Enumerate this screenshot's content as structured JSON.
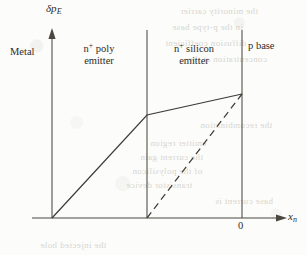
{
  "figure": {
    "background_color": "#fcfcfa",
    "ink_color": "#403d37"
  },
  "axes": {
    "y_label_main": "δp",
    "y_label_sub": "E",
    "x_label_main": "x",
    "x_label_sub": "n",
    "x_tick_label": "0",
    "x_axis_from_px": 32,
    "x_axis_to_px": 285,
    "x_axis_y_px": 218,
    "y_axis_x_px": 52,
    "y_axis_top_px": 33,
    "y_axis_bottom_px": 218
  },
  "regions": [
    {
      "name": "metal",
      "label_line1": "Metal",
      "label_line2": "",
      "superscript": "",
      "x_center_px": 30,
      "y_px": 52
    },
    {
      "name": "poly-emitter",
      "label_line1": "n poly",
      "label_line2": "emitter",
      "superscript": "+",
      "x_center_px": 99,
      "y_px": 46
    },
    {
      "name": "silicon-emitter",
      "label_line1": "n silicon",
      "label_line2": "emitter",
      "superscript": "+",
      "x_center_px": 194,
      "y_px": 46
    },
    {
      "name": "p-base",
      "label_line1": "p base",
      "label_line2": "",
      "superscript": "",
      "x_center_px": 268,
      "y_px": 46
    }
  ],
  "dividers": [
    {
      "name": "poly-silicon-interface",
      "x_px": 147,
      "y_top_px": 30,
      "y_bottom_px": 218
    },
    {
      "name": "emitter-base-junction",
      "x_px": 242,
      "y_top_px": 30,
      "y_bottom_px": 218
    }
  ],
  "chart_data": {
    "type": "line",
    "xlabel": "x_n",
    "ylabel": "δp_E",
    "grid": false,
    "legend": "none",
    "series": [
      {
        "name": "polysilicon-emitter-profile-solid",
        "style": "solid",
        "points_px": [
          [
            52,
            218
          ],
          [
            147,
            115
          ],
          [
            242,
            94
          ]
        ],
        "description": "Steep linear rise through the n+ poly emitter, then a shallower linear rise across the n+ silicon emitter to the base edge"
      },
      {
        "name": "ideal-emitter-profile-dashed",
        "style": "dashed",
        "points_px": [
          [
            147,
            218
          ],
          [
            242,
            94
          ]
        ],
        "description": "Dashed reference line: linear profile starting at zero at the poly/silicon interface rising to the same value at the base edge"
      }
    ]
  },
  "ghost_text": [
    {
      "text": "the minority carrier",
      "x_px": 180,
      "y_px": 6
    },
    {
      "text": "in the p-type base",
      "x_px": 172,
      "y_px": 22
    },
    {
      "text": "diffusion coefficient",
      "x_px": 165,
      "y_px": 38
    },
    {
      "text": "concentration at the",
      "x_px": 188,
      "y_px": 54
    },
    {
      "text": "emitter region",
      "x_px": 150,
      "y_px": 138
    },
    {
      "text": "the current gain",
      "x_px": 140,
      "y_px": 152
    },
    {
      "text": "of the polysilicon",
      "x_px": 132,
      "y_px": 166
    },
    {
      "text": "transistor device",
      "x_px": 126,
      "y_px": 180
    },
    {
      "text": "the recombination",
      "x_px": 200,
      "y_px": 120
    },
    {
      "text": "base current is",
      "x_px": 215,
      "y_px": 196
    },
    {
      "text": "the injected hole",
      "x_px": 40,
      "y_px": 240
    }
  ]
}
